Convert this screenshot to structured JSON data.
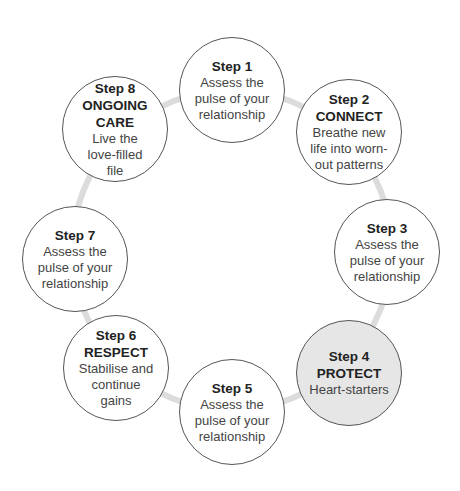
{
  "diagram": {
    "type": "cycle",
    "ring_color": "#dcdcdc",
    "node_border_color": "#555555",
    "highlight_fill": "#e6e6e6",
    "steps": [
      {
        "step": "Step 1",
        "title": "",
        "desc": "Assess the pulse of your relationship",
        "highlighted": false
      },
      {
        "step": "Step 2",
        "title": "CONNECT",
        "desc": "Breathe new life into worn-out patterns",
        "highlighted": false
      },
      {
        "step": "Step 3",
        "title": "",
        "desc": "Assess the pulse of your relationship",
        "highlighted": false
      },
      {
        "step": "Step 4",
        "title": "PROTECT",
        "desc": "Heart-starters",
        "highlighted": true
      },
      {
        "step": "Step 5",
        "title": "",
        "desc": "Assess the pulse of your relationship",
        "highlighted": false
      },
      {
        "step": "Step 6",
        "title": "RESPECT",
        "desc": "Stabilise and continue gains",
        "highlighted": false
      },
      {
        "step": "Step 7",
        "title": "",
        "desc": "Assess the pulse of your relationship",
        "highlighted": false
      },
      {
        "step": "Step 8",
        "title": "ONGOING CARE",
        "desc": "Live the love-filled file",
        "highlighted": false
      }
    ]
  }
}
